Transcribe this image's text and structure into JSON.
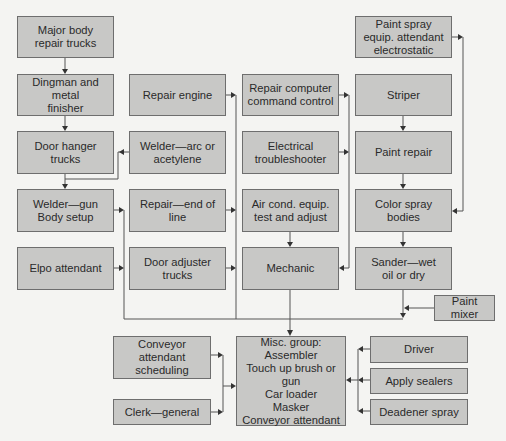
{
  "diagram": {
    "type": "flowchart",
    "colors": {
      "box_fill": "#c8c8c6",
      "box_border": "#6e6e6e",
      "line": "#555555",
      "background": "#f4f4f2"
    },
    "nodes": [
      {
        "id": "major_body",
        "label": "Major body\nrepair trucks",
        "x": 17,
        "y": 16,
        "w": 97,
        "h": 42
      },
      {
        "id": "dingman",
        "label": "Dingman and metal\nfinisher",
        "x": 17,
        "y": 74,
        "w": 97,
        "h": 42
      },
      {
        "id": "door_hanger",
        "label": "Door hanger\ntrucks",
        "x": 17,
        "y": 131,
        "w": 97,
        "h": 43
      },
      {
        "id": "welder_gun",
        "label": "Welder—gun\nBody setup",
        "x": 17,
        "y": 189,
        "w": 97,
        "h": 43
      },
      {
        "id": "elpo",
        "label": "Elpo attendant",
        "x": 17,
        "y": 247,
        "w": 97,
        "h": 43
      },
      {
        "id": "repair_engine",
        "label": "Repair engine",
        "x": 129,
        "y": 74,
        "w": 97,
        "h": 42
      },
      {
        "id": "welder_arc",
        "label": "Welder—arc or\nacetylene",
        "x": 129,
        "y": 131,
        "w": 97,
        "h": 43
      },
      {
        "id": "repair_end",
        "label": "Repair—end of\nline",
        "x": 129,
        "y": 189,
        "w": 97,
        "h": 43
      },
      {
        "id": "door_adjuster",
        "label": "Door adjuster\ntrucks",
        "x": 129,
        "y": 247,
        "w": 97,
        "h": 43
      },
      {
        "id": "repair_computer",
        "label": "Repair computer\ncommand control",
        "x": 242,
        "y": 74,
        "w": 97,
        "h": 42
      },
      {
        "id": "electrical",
        "label": "Electrical\ntroubleshooter",
        "x": 242,
        "y": 131,
        "w": 97,
        "h": 43
      },
      {
        "id": "air_cond",
        "label": "Air cond. equip.\ntest and adjust",
        "x": 242,
        "y": 189,
        "w": 97,
        "h": 43
      },
      {
        "id": "mechanic",
        "label": "Mechanic",
        "x": 242,
        "y": 247,
        "w": 97,
        "h": 43
      },
      {
        "id": "paint_spray",
        "label": "Paint spray\nequip. attendant\nelectrostatic",
        "x": 355,
        "y": 16,
        "w": 97,
        "h": 42
      },
      {
        "id": "striper",
        "label": "Striper",
        "x": 355,
        "y": 74,
        "w": 97,
        "h": 42
      },
      {
        "id": "paint_repair",
        "label": "Paint repair",
        "x": 355,
        "y": 131,
        "w": 97,
        "h": 43
      },
      {
        "id": "color_spray",
        "label": "Color spray\nbodies",
        "x": 355,
        "y": 189,
        "w": 97,
        "h": 43
      },
      {
        "id": "sander",
        "label": "Sander—wet\noil or dry",
        "x": 355,
        "y": 247,
        "w": 97,
        "h": 43
      },
      {
        "id": "paint_mixer",
        "label": "Paint mixer",
        "x": 434,
        "y": 295,
        "w": 61,
        "h": 26
      },
      {
        "id": "conveyor_sched",
        "label": "Conveyor\nattendant\nscheduling",
        "x": 113,
        "y": 336,
        "w": 98,
        "h": 43
      },
      {
        "id": "clerk",
        "label": "Clerk—general",
        "x": 113,
        "y": 399,
        "w": 98,
        "h": 26
      },
      {
        "id": "misc_group",
        "label": "Misc. group:\nAssembler\nTouch up brush or gun\nCar loader\nMasker\nConveyor attendant",
        "x": 236,
        "y": 336,
        "w": 110,
        "h": 90
      },
      {
        "id": "driver",
        "label": "Driver",
        "x": 370,
        "y": 336,
        "w": 98,
        "h": 27
      },
      {
        "id": "apply_sealers",
        "label": "Apply sealers",
        "x": 370,
        "y": 368,
        "w": 98,
        "h": 26
      },
      {
        "id": "deadener",
        "label": "Deadener spray",
        "x": 370,
        "y": 399,
        "w": 98,
        "h": 26
      }
    ],
    "edges": [
      {
        "from": "major_body",
        "to": "dingman"
      },
      {
        "from": "dingman",
        "to": "door_hanger"
      },
      {
        "from": "welder_arc",
        "to": "door_hanger_line"
      },
      {
        "from": "door_hanger",
        "to": "welder_gun"
      },
      {
        "from": "welder_gun",
        "to": "misc_group"
      },
      {
        "from": "elpo",
        "to": "misc_group"
      },
      {
        "from": "repair_engine",
        "to": "misc_group"
      },
      {
        "from": "repair_end",
        "to": "misc_group"
      },
      {
        "from": "door_adjuster",
        "to": "misc_group"
      },
      {
        "from": "repair_computer",
        "to": "mechanic"
      },
      {
        "from": "electrical",
        "to": "mechanic"
      },
      {
        "from": "air_cond",
        "to": "mechanic"
      },
      {
        "from": "mechanic",
        "to": "misc_group"
      },
      {
        "from": "paint_spray",
        "to": "color_spray"
      },
      {
        "from": "striper",
        "to": "paint_repair"
      },
      {
        "from": "paint_repair",
        "to": "color_spray"
      },
      {
        "from": "color_spray",
        "to": "sander"
      },
      {
        "from": "sander",
        "to": "misc_group"
      },
      {
        "from": "paint_mixer",
        "to": "misc_group"
      },
      {
        "from": "conveyor_sched",
        "to": "misc_group"
      },
      {
        "from": "clerk",
        "to": "misc_group"
      },
      {
        "from": "driver",
        "to": "misc_group"
      },
      {
        "from": "apply_sealers",
        "to": "misc_group"
      },
      {
        "from": "deadener",
        "to": "misc_group"
      }
    ]
  }
}
